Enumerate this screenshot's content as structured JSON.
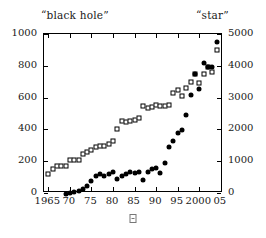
{
  "chart_data": {
    "type": "scatter",
    "title": "",
    "xlabel_glyph": "tofu-box-glyph",
    "axis_titles": {
      "left": "“black hole”",
      "right": "“star”"
    },
    "xlim": [
      1964,
      2005.5
    ],
    "x_ticks": [
      1965,
      1970,
      1975,
      1980,
      1985,
      1990,
      1995,
      2000,
      2005
    ],
    "x_tick_labels": [
      "1965",
      "70",
      "75",
      "80",
      "85",
      "90",
      "95",
      "2000",
      "05"
    ],
    "left_ylim": [
      0,
      1000
    ],
    "left_y_ticks": [
      0,
      200,
      400,
      600,
      800,
      1000
    ],
    "left_y_tick_labels": [
      "0",
      "200",
      "400",
      "600",
      "800",
      "1000"
    ],
    "right_ylim": [
      0,
      5000
    ],
    "right_y_ticks": [
      0,
      1000,
      2000,
      3000,
      4000,
      5000
    ],
    "right_y_tick_labels": [
      "0",
      "1000",
      "2000",
      "3000",
      "4000",
      "5000"
    ],
    "grid": false,
    "legend": "none",
    "series": [
      {
        "name": "“black hole”",
        "marker": "open-square",
        "axis": "left",
        "color": "#000000",
        "x": [
          1965,
          1966,
          1967,
          1968,
          1969,
          1970,
          1971,
          1972,
          1973,
          1974,
          1975,
          1976,
          1977,
          1978,
          1979,
          1980,
          1981,
          1982,
          1983,
          1984,
          1985,
          1986,
          1987,
          1988,
          1989,
          1990,
          1991,
          1992,
          1993,
          1994,
          1995,
          1996,
          1997,
          1998,
          1999,
          2000,
          2001,
          2002,
          2003,
          2004
        ],
        "values": [
          118,
          150,
          168,
          168,
          172,
          205,
          208,
          210,
          248,
          258,
          272,
          288,
          295,
          298,
          308,
          330,
          400,
          455,
          448,
          452,
          458,
          470,
          548,
          535,
          540,
          552,
          548,
          550,
          555,
          628,
          645,
          612,
          660,
          700,
          750,
          690,
          748,
          795,
          760,
          898
        ]
      },
      {
        "name": "“star”",
        "marker": "filled-circle",
        "axis": "right",
        "color": "#000000",
        "x": [
          1969,
          1970,
          1971,
          1972,
          1973,
          1974,
          1975,
          1976,
          1977,
          1978,
          1979,
          1980,
          1981,
          1982,
          1983,
          1984,
          1985,
          1986,
          1987,
          1988,
          1989,
          1990,
          1991,
          1992,
          1993,
          1994,
          1995,
          1996,
          1997,
          1998,
          1999,
          2000,
          2001,
          2002,
          2003,
          2004
        ],
        "values": [
          -25,
          -15,
          45,
          60,
          130,
          230,
          375,
          530,
          610,
          530,
          590,
          660,
          450,
          530,
          600,
          650,
          640,
          660,
          420,
          670,
          760,
          800,
          640,
          950,
          1440,
          1620,
          1900,
          1970,
          2450,
          3070,
          3750,
          3270,
          4090,
          3960,
          3950,
          4740
        ]
      }
    ]
  }
}
